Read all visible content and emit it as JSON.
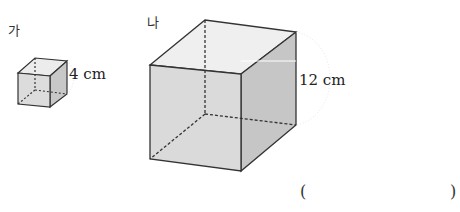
{
  "figures": [
    {
      "id": "ga",
      "label": "가",
      "edge_length": "4 cm"
    },
    {
      "id": "na",
      "label": "나",
      "edge_length": "12 cm"
    }
  ],
  "answer": {
    "open": "(",
    "close": ")",
    "value": ""
  }
}
